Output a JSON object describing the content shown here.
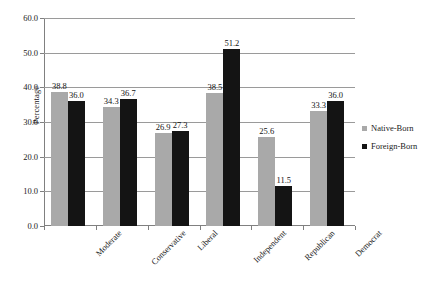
{
  "chart_data": {
    "type": "bar",
    "title": "",
    "subtitle": "",
    "xlabel": "",
    "ylabel": "Percentage",
    "ylim": [
      0,
      60
    ],
    "ytick_step": 10,
    "ytick_labels": [
      "60.0",
      "50.0",
      "40.0",
      "30.0",
      "20.0",
      "10.0",
      "0.0"
    ],
    "ytick_values": [
      60,
      50,
      40,
      30,
      20,
      10,
      0
    ],
    "grid": true,
    "grid_axis": "y",
    "legend_position": "right",
    "categories": [
      "Moderate",
      "Conservative",
      "Liberal",
      "Independent",
      "Republican",
      "Democrat"
    ],
    "series": [
      {
        "name": "Native-Born",
        "color": "#a9a9a9",
        "values": [
          38.8,
          34.3,
          26.9,
          38.5,
          25.6,
          33.3
        ],
        "labels": [
          "38.8",
          "34.3",
          "26.9",
          "38.5",
          "25.6",
          "33.3"
        ]
      },
      {
        "name": "Foreign-Born",
        "color": "#141414",
        "values": [
          36.0,
          36.7,
          27.3,
          51.2,
          11.5,
          36.0
        ],
        "labels": [
          "36.0",
          "36.7",
          "27.3",
          "51.2",
          "11.5",
          "36.0"
        ]
      }
    ]
  },
  "legend": {
    "items": [
      {
        "label": "Native-Born",
        "marker": "square-gray"
      },
      {
        "label": "Foreign-Born",
        "marker": "square-black"
      }
    ]
  },
  "axes": {
    "y_title": "Percentage"
  }
}
